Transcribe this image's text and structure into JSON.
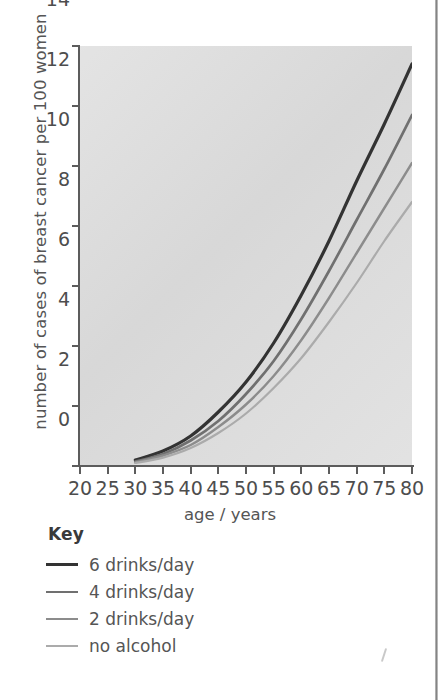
{
  "chart_data": {
    "type": "line",
    "title": "",
    "xlabel": "age / years",
    "ylabel": "number of cases of breast cancer per 100 women",
    "xlim": [
      20,
      80
    ],
    "ylim": [
      0,
      14
    ],
    "xticks": [
      20,
      25,
      30,
      35,
      40,
      45,
      50,
      55,
      60,
      65,
      70,
      75,
      80
    ],
    "yticks": [
      0,
      2,
      4,
      6,
      8,
      10,
      12,
      14
    ],
    "grid": false,
    "legend_position": "below-plot-left",
    "legend_title": "Key",
    "plot_background": "#dcdcdc",
    "x": [
      30,
      35,
      40,
      45,
      50,
      55,
      60,
      65,
      70,
      75,
      80
    ],
    "series": [
      {
        "name": "6 drinks/day",
        "color": "#333333",
        "values": [
          0.2,
          0.5,
          1.0,
          1.8,
          2.8,
          4.1,
          5.7,
          7.5,
          9.5,
          11.4,
          13.4
        ]
      },
      {
        "name": "4 drinks/day",
        "color": "#707070",
        "values": [
          0.15,
          0.4,
          0.85,
          1.5,
          2.4,
          3.5,
          4.9,
          6.5,
          8.2,
          9.9,
          11.7
        ]
      },
      {
        "name": "2 drinks/day",
        "color": "#8c8c8c",
        "values": [
          0.12,
          0.35,
          0.7,
          1.3,
          2.05,
          3.0,
          4.2,
          5.6,
          7.1,
          8.6,
          10.1
        ]
      },
      {
        "name": "no alcohol",
        "color": "#ababab",
        "values": [
          0.1,
          0.28,
          0.6,
          1.1,
          1.75,
          2.6,
          3.6,
          4.8,
          6.1,
          7.5,
          8.8
        ]
      }
    ]
  },
  "axes": {
    "y_title": "number of cases of breast cancer per 100 women",
    "x_title": "age / years",
    "y_tick_labels": [
      "0",
      "2",
      "4",
      "6",
      "8",
      "10",
      "12",
      "14"
    ],
    "x_tick_labels": [
      "20",
      "25",
      "30",
      "35",
      "40",
      "45",
      "50",
      "55",
      "60",
      "65",
      "70",
      "75",
      "80"
    ]
  },
  "key": {
    "title": "Key",
    "items": [
      {
        "label": "6 drinks/day",
        "color": "#333333",
        "width": 3.1
      },
      {
        "label": "4 drinks/day",
        "color": "#707070",
        "width": 2.6
      },
      {
        "label": "2 drinks/day",
        "color": "#8c8c8c",
        "width": 2.3
      },
      {
        "label": "no alcohol",
        "color": "#ababab",
        "width": 2.1
      }
    ]
  }
}
